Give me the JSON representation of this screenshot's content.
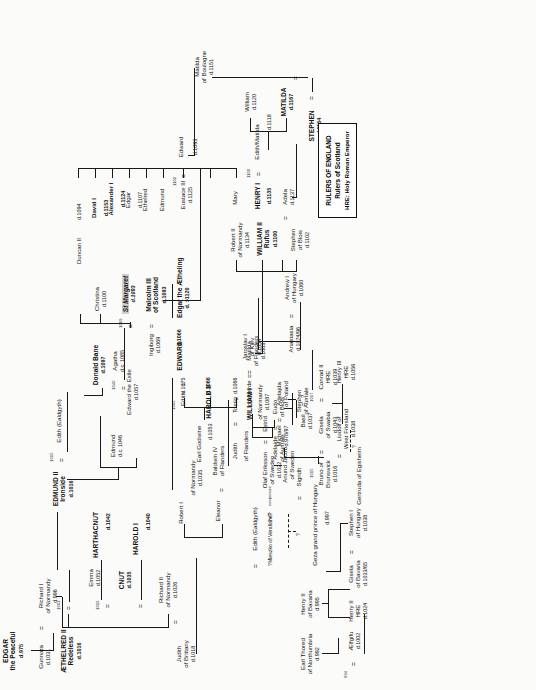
{
  "document": {
    "type": "genealogical-family-tree",
    "subject": "Anglo-Saxon, Norman, Danish, Scottish and Continental royal descent, c.975 - c.1167",
    "orientation": "landscape chart printed sideways on portrait page (rotated 90 degrees counter-clockwise)"
  },
  "legend": {
    "line1": "RULERS OF ENGLAND",
    "line2": "Rulers of Scotland",
    "line3": "HRE: Holy Roman Emperor"
  },
  "symbols": {
    "marriage": "=",
    "uncertain": "?",
    "conjecture_note": "conjecture",
    "died_prefix": "d.",
    "died_circa_prefix": "d.c.",
    "died_before_prefix": "d.<",
    "died_after_prefix": "d. >"
  },
  "people": [
    {
      "id": "gunnora",
      "name": "Gunnora",
      "lines": [],
      "death": "d.1031"
    },
    {
      "id": "richard1",
      "name": "Richard I",
      "lines": [
        "of Normandy"
      ],
      "death": "d.996"
    },
    {
      "id": "edgar",
      "name": "EDGAR",
      "lines": [
        "the Peaceful"
      ],
      "death": "d.975",
      "bold": true
    },
    {
      "id": "judith_brittany",
      "name": "Judith",
      "lines": [
        "of Brittany"
      ],
      "death": "d.1018"
    },
    {
      "id": "richard2",
      "name": "Richard II",
      "lines": [
        "of Normandy"
      ],
      "death": "d.1026"
    },
    {
      "id": "cnut",
      "name": "CNUT",
      "lines": [],
      "death": "d.1035",
      "bold": true
    },
    {
      "id": "emma",
      "name": "Emma",
      "lines": [],
      "death": "d.1052"
    },
    {
      "id": "aethelred",
      "name": "ÆTHELRED II",
      "lines": [
        "Redeless"
      ],
      "death": "d.1016",
      "bold": true
    },
    {
      "id": "robert1",
      "name": "Robert I",
      "lines": [
        "of Normandy"
      ],
      "death": "d.1035"
    },
    {
      "id": "eleanor",
      "name": "Eleanor",
      "lines": [],
      "death": ""
    },
    {
      "id": "baldwin4",
      "name": "Baldwin IV",
      "lines": [
        "of Flanders"
      ],
      "death": ""
    },
    {
      "id": "harold1",
      "name": "HAROLD I",
      "lines": [],
      "death": "d.1040",
      "bold": true
    },
    {
      "id": "harthacnut",
      "name": "HARTHACNUT",
      "lines": [],
      "death": "d.1042",
      "bold": true
    },
    {
      "id": "edmund_ironside",
      "name": "EDMUND II",
      "lines": [
        "Ironside"
      ],
      "death": "d.1016",
      "bold": true
    },
    {
      "id": "earl_godwine",
      "name": "Earl Godwine",
      "lines": [],
      "death": "d.1053"
    },
    {
      "id": "judith_flanders",
      "name": "Judith",
      "lines": [
        "of Flanders"
      ],
      "death": ""
    },
    {
      "id": "tostig",
      "name": "Tostig",
      "lines": [],
      "death": "d.1066"
    },
    {
      "id": "harold2",
      "name": "HAROLD II",
      "lines": [],
      "death": "d.1066",
      "bold": true
    },
    {
      "id": "edith_godwine",
      "name": "Edith",
      "lines": [],
      "death": "d.1075"
    },
    {
      "id": "edward_confessor",
      "name": "EDWARD",
      "lines": [],
      "death": "d.1066",
      "bold": true
    },
    {
      "id": "adelaide",
      "name": "Adelaide",
      "lines": [
        "of Aumale"
      ],
      "death": ""
    },
    {
      "id": "eudo",
      "name": "Eudo",
      "lines": [
        "of Blois"
      ],
      "death": ""
    },
    {
      "id": "stephen_aumale",
      "name": "Stephen",
      "lines": [
        "of Aumale"
      ],
      "death": ""
    },
    {
      "id": "william1",
      "name": "WILLIAM I",
      "lines": [
        "of Normandy"
      ],
      "death": "d.1087",
      "bold": true
    },
    {
      "id": "matilda_flanders",
      "name": "Matilda",
      "lines": [
        "of Flanders"
      ],
      "death": "d.1083"
    },
    {
      "id": "edmund",
      "name": "Edmund",
      "lines": [],
      "death": "d.c. 1046"
    },
    {
      "id": "donald_bane",
      "name": "Donald Bane",
      "lines": [],
      "death": "d.1097",
      "bold": true
    },
    {
      "id": "robert3",
      "name": "Robert II",
      "lines": [
        "of Normandy"
      ],
      "death": "d.1134"
    },
    {
      "id": "william2",
      "name": "WILLIAM II",
      "lines": [
        "Rufus"
      ],
      "death": "d.1100",
      "bold": true
    },
    {
      "id": "stephen_blois",
      "name": "Stephen",
      "lines": [
        "of Blois"
      ],
      "death": "d.1102"
    },
    {
      "id": "adela",
      "name": "Adela",
      "lines": [],
      "death": "d.1137"
    },
    {
      "id": "henry1",
      "name": "HENRY I",
      "lines": [],
      "death": "d.1135",
      "bold": true
    },
    {
      "id": "edith_matilda",
      "name": "Edith/Matilda",
      "lines": [],
      "death": "d.1118"
    },
    {
      "id": "william_adelin",
      "name": "William",
      "lines": [],
      "death": "d.1120"
    },
    {
      "id": "matilda_empress",
      "name": "MATILDA",
      "lines": [],
      "death": "d.1167",
      "bold": true
    },
    {
      "id": "stephen_king",
      "name": "STEPHEN",
      "lines": [],
      "death": "d.1154",
      "bold": true
    },
    {
      "id": "matilda_boulogne",
      "name": "Matilda",
      "lines": [
        "of Boulogne"
      ],
      "death": "d.1151"
    },
    {
      "id": "earl_thored",
      "name": "Earl Thored",
      "lines": [
        "of Northumbria"
      ],
      "death": "d.992"
    },
    {
      "id": "aelfgifu",
      "name": "Ælfgifu",
      "lines": [],
      "death": "d.1002"
    },
    {
      "id": "henry2_bavaria",
      "name": "Henry II",
      "lines": [
        "of Bavaria"
      ],
      "death": "d.995"
    },
    {
      "id": "henry2_hre",
      "name": "Henry II",
      "lines": [
        "HRE"
      ],
      "death": "d.1024"
    },
    {
      "id": "gisela_bavaria",
      "name": "Gisela",
      "lines": [
        "of Bavaria"
      ],
      "death": "d.1033/65"
    },
    {
      "id": "stephen1_hungary",
      "name": "Stephen I",
      "lines": [
        "of Hungary"
      ],
      "death": "d.1038"
    },
    {
      "id": "geza",
      "name": "Geza grand prince of Hungary",
      "lines": [],
      "death": "d.997"
    },
    {
      "id": "michael",
      "name": "Michael",
      "lines": [],
      "death": "d.978/97"
    },
    {
      "id": "adelajda",
      "name": "Adelajda",
      "lines": [
        "of Poland"
      ],
      "death": ""
    },
    {
      "id": "basil",
      "name": "Basil",
      "lines": [],
      "death": "d.1037"
    },
    {
      "id": "basil_wife",
      "name": "?",
      "lines": [],
      "death": ""
    },
    {
      "id": "mieszko",
      "name": "?Mieszko of Vendland?",
      "lines": [],
      "death": ""
    },
    {
      "id": "edith_ealdgyth",
      "name": "Edith (Ealdgyth)",
      "lines": [],
      "death": ""
    },
    {
      "id": "olaf_eriksson",
      "name": "Olaf Eriksson",
      "lines": [
        "of Sweden"
      ],
      "death": "d.1022"
    },
    {
      "id": "estrid",
      "name": "Estrid",
      "lines": [],
      "death": ""
    },
    {
      "id": "sigridh",
      "name": "Sigridh",
      "lines": [],
      "death": ""
    },
    {
      "id": "anund_jacob",
      "name": "Anund Jacob",
      "lines": [
        "of Sweden"
      ],
      "death": ""
    },
    {
      "id": "ingegerde",
      "name": "Ingegerde",
      "lines": [],
      "death": ""
    },
    {
      "id": "jaroslav",
      "name": "Jaroslav I",
      "lines": [
        "of Kiev"
      ],
      "death": "d.1054"
    },
    {
      "id": "bruno",
      "name": "Bruno of",
      "lines": [
        "Brunswick"
      ],
      "death": "d.1016"
    },
    {
      "id": "gisela_swabia",
      "name": "Gisela",
      "lines": [
        "of Swabia"
      ],
      "death": "d.1043"
    },
    {
      "id": "conrad2",
      "name": "Conrad II",
      "lines": [
        "HRE"
      ],
      "death": "d.1039"
    },
    {
      "id": "liudolf",
      "name": "Liudolf of",
      "lines": [
        "West Friesland"
      ],
      "death": "d.1038"
    },
    {
      "id": "henry3",
      "name": "Henry III",
      "lines": [
        "HRE"
      ],
      "death": "d.1056"
    },
    {
      "id": "gertruda",
      "name": "Gertruda of Egisheim",
      "lines": [],
      "death": ""
    },
    {
      "id": "agatha",
      "name": "Agatha",
      "lines": [],
      "death": "d.c. 1085"
    },
    {
      "id": "anastasia",
      "name": "Anastasia",
      "lines": [],
      "death": "d.1074/96"
    },
    {
      "id": "andrew1",
      "name": "Andrew I",
      "lines": [
        "of Hungary"
      ],
      "death": "d.1060"
    },
    {
      "id": "edward_exile",
      "name": "Edward the Exile",
      "lines": [],
      "death": "d.1057"
    },
    {
      "id": "ingiborg",
      "name": "Ingiborg",
      "lines": [],
      "death": "d.1069"
    },
    {
      "id": "malcolm3",
      "name": "Malcolm III",
      "lines": [
        "of Scotland"
      ],
      "death": "d.1093",
      "bold": true
    },
    {
      "id": "st_margaret",
      "name": "St Margaret",
      "lines": [],
      "death": "d.1093",
      "highlight": true
    },
    {
      "id": "christina",
      "name": "Christina",
      "lines": [],
      "death": "d.1100"
    },
    {
      "id": "edgar_atheling",
      "name": "Edgar the Ætheling",
      "lines": [],
      "death": "d. >1120"
    },
    {
      "id": "duncan2",
      "name": "Duncan II",
      "lines": [],
      "death": "d.1094",
      "bold": true
    },
    {
      "id": "matilda_sc",
      "name": "Matilda",
      "lines": [],
      "death": "d.1118"
    },
    {
      "id": "mary",
      "name": "Mary",
      "lines": [],
      "death": "d.1115"
    },
    {
      "id": "eustace3",
      "name": "Eustace III",
      "lines": [
        "of Boulogne"
      ],
      "death": "d.1125"
    },
    {
      "id": "edward_sc",
      "name": "Edward",
      "lines": [],
      "death": "d.1093"
    },
    {
      "id": "edmund_sc",
      "name": "Edmund",
      "lines": [],
      "death": ""
    },
    {
      "id": "ethelred_sc",
      "name": "Ethelred",
      "lines": [],
      "death": "d.<1072"
    },
    {
      "id": "edgar_sc",
      "name": "Edgar",
      "lines": [],
      "death": "d.1107",
      "bold": true
    },
    {
      "id": "alexander1",
      "name": "Alexander I",
      "lines": [],
      "death": "d.1124",
      "bold": true
    },
    {
      "id": "david1",
      "name": "David I",
      "lines": [],
      "death": "d.1153",
      "bold": true
    }
  ],
  "marriage_dates": [
    "1002",
    "1016",
    "1015",
    "994",
    "1045",
    "1040",
    "1069",
    "1102",
    "1100",
    "1017",
    "1015"
  ],
  "annotations": {
    "conjecture": "conjecture",
    "question": "?",
    "double_question": "?=?"
  }
}
